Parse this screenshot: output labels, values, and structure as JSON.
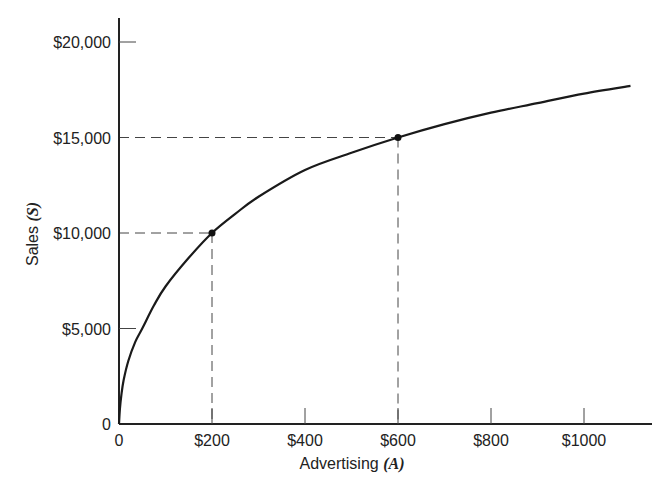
{
  "chart_data": {
    "type": "line",
    "title": "",
    "xlabel": "Advertising",
    "xlabel_var": "(A)",
    "ylabel": "Sales",
    "ylabel_var": "(S)",
    "xlim": [
      0,
      1150
    ],
    "ylim": [
      0,
      21000
    ],
    "grid": false,
    "legend": null,
    "x_ticks": [
      {
        "value": 0,
        "label": "0"
      },
      {
        "value": 200,
        "label": "$200"
      },
      {
        "value": 400,
        "label": "$400"
      },
      {
        "value": 600,
        "label": "$600"
      },
      {
        "value": 800,
        "label": "$800"
      },
      {
        "value": 1000,
        "label": "$1000"
      }
    ],
    "y_ticks": [
      {
        "value": 0,
        "label": "0"
      },
      {
        "value": 5000,
        "label": "$5,000"
      },
      {
        "value": 10000,
        "label": "$10,000"
      },
      {
        "value": 15000,
        "label": "$15,000"
      },
      {
        "value": 20000,
        "label": "$20,000"
      }
    ],
    "series": [
      {
        "name": "Sales response curve",
        "x": [
          0,
          2,
          5,
          10,
          20,
          35,
          50,
          75,
          100,
          150,
          200,
          250,
          300,
          400,
          500,
          600,
          700,
          800,
          900,
          1000,
          1100
        ],
        "y": [
          0,
          800,
          1500,
          2300,
          3300,
          4300,
          5000,
          6200,
          7200,
          8700,
          10000,
          11000,
          11900,
          13300,
          14200,
          15000,
          15700,
          16300,
          16800,
          17300,
          17700
        ]
      }
    ],
    "highlighted_points": [
      {
        "x": 200,
        "y": 10000
      },
      {
        "x": 600,
        "y": 15000
      }
    ],
    "annotations": [
      "Dashed reference lines from (200, 10000) to both axes",
      "Dashed reference lines from (600, 15000) to both axes"
    ]
  }
}
